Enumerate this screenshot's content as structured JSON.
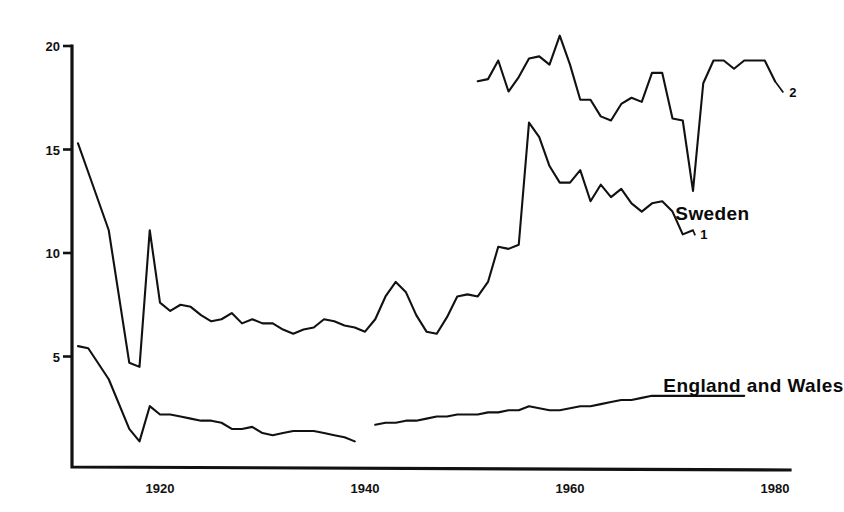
{
  "chart_data": {
    "type": "line",
    "title": "",
    "subtitle": "",
    "xlabel": "",
    "ylabel": "",
    "xlim": [
      1911,
      1981
    ],
    "ylim": [
      0,
      20.8
    ],
    "grid": false,
    "legend_position": "inline-annotations",
    "y_ticks": [
      5,
      10,
      15,
      20
    ],
    "y_tick_labels": [
      "5",
      "10",
      "15",
      "20"
    ],
    "x_ticks": [
      1920,
      1940,
      1960,
      1980
    ],
    "x_tick_labels": [
      "1920",
      "1940",
      "1960",
      "1980"
    ],
    "annotations": [
      {
        "text": "Sweden",
        "x": 1973.9,
        "y": 11.95,
        "style": "bold"
      },
      {
        "text": "England and Wales",
        "x": 1977.9,
        "y": 3.62,
        "style": "bold"
      },
      {
        "text": "1",
        "x": 1972.5,
        "y": 10.9,
        "style": "series-end-marker"
      },
      {
        "text": "2",
        "x": 1981.2,
        "y": 17.8,
        "style": "series-end-marker"
      }
    ],
    "series": [
      {
        "name": "Sweden 1",
        "end_label": "1",
        "x": [
          1912,
          1913,
          1915,
          1917,
          1918,
          1919,
          1920,
          1921,
          1922,
          1923,
          1924,
          1925,
          1926,
          1927,
          1928,
          1929,
          1930,
          1931,
          1932,
          1933,
          1934,
          1935,
          1936,
          1937,
          1938,
          1939,
          1940,
          1941,
          1942,
          1943,
          1944,
          1945,
          1946,
          1947,
          1948,
          1949,
          1950,
          1951,
          1952,
          1953,
          1954,
          1955,
          1956,
          1957,
          1958,
          1959,
          1960,
          1961,
          1962,
          1963,
          1964,
          1965,
          1966,
          1967,
          1968,
          1969,
          1970,
          1971,
          1972
        ],
        "values": [
          15.3,
          13.9,
          11.1,
          4.7,
          4.5,
          11.1,
          7.6,
          7.2,
          7.5,
          7.4,
          7.0,
          6.7,
          6.8,
          7.1,
          6.6,
          6.8,
          6.6,
          6.6,
          6.3,
          6.1,
          6.3,
          6.4,
          6.8,
          6.7,
          6.5,
          6.4,
          6.2,
          6.8,
          7.9,
          8.6,
          8.1,
          7.0,
          6.2,
          6.1,
          6.9,
          7.9,
          8.0,
          7.9,
          8.6,
          10.3,
          10.2,
          10.4,
          16.3,
          15.6,
          14.2,
          13.4,
          13.4,
          14.0,
          12.5,
          13.3,
          12.7,
          13.1,
          12.4,
          12.0,
          12.4,
          12.5,
          12.0,
          10.9,
          11.1
        ],
        "style": "solid-line"
      },
      {
        "name": "Sweden 2",
        "end_label": "2",
        "x": [
          1951,
          1952,
          1953,
          1954,
          1955,
          1956,
          1957,
          1958,
          1959,
          1960,
          1961,
          1962,
          1963,
          1964,
          1965,
          1966,
          1967,
          1968,
          1969,
          1970,
          1971,
          1972,
          1973,
          1974,
          1975,
          1976,
          1977,
          1978,
          1979,
          1980
        ],
        "values": [
          18.3,
          18.4,
          19.3,
          17.8,
          18.5,
          19.4,
          19.5,
          19.1,
          20.5,
          19.1,
          17.4,
          17.4,
          16.6,
          16.4,
          17.2,
          17.5,
          17.3,
          18.7,
          18.7,
          16.5,
          16.4,
          13.0,
          18.2,
          19.3,
          19.3,
          18.9,
          19.3,
          19.3,
          19.3,
          18.3
        ],
        "style": "solid-line"
      },
      {
        "name": "England and Wales",
        "segments": [
          {
            "x": [
              1912,
              1913,
              1915,
              1917,
              1918,
              1919,
              1920,
              1921,
              1922,
              1923,
              1924,
              1925,
              1926,
              1927,
              1928,
              1929,
              1930,
              1931,
              1932,
              1933,
              1934,
              1935,
              1936,
              1937,
              1938,
              1939
            ],
            "values": [
              5.5,
              5.4,
              3.9,
              1.5,
              0.9,
              2.6,
              2.2,
              2.2,
              2.1,
              2.0,
              1.9,
              1.9,
              1.8,
              1.5,
              1.5,
              1.6,
              1.3,
              1.2,
              1.3,
              1.4,
              1.4,
              1.4,
              1.3,
              1.2,
              1.1,
              0.9
            ]
          },
          {
            "x": [
              1941,
              1942,
              1943,
              1944,
              1945,
              1946,
              1947,
              1948,
              1949,
              1950,
              1951,
              1952,
              1953,
              1954,
              1955,
              1956,
              1957,
              1958,
              1959,
              1960,
              1961,
              1962,
              1963,
              1964,
              1965,
              1966,
              1967,
              1968,
              1969,
              1970,
              1971,
              1972,
              1973,
              1974,
              1975,
              1976,
              1977
            ],
            "values": [
              1.7,
              1.8,
              1.8,
              1.9,
              1.9,
              2.0,
              2.1,
              2.1,
              2.2,
              2.2,
              2.2,
              2.3,
              2.3,
              2.4,
              2.4,
              2.6,
              2.5,
              2.4,
              2.4,
              2.5,
              2.6,
              2.6,
              2.7,
              2.8,
              2.9,
              2.9,
              3.0,
              3.1,
              3.1,
              3.1,
              3.1,
              3.1,
              3.1,
              3.1,
              3.1,
              3.1,
              3.1
            ]
          }
        ],
        "style": "solid-line"
      }
    ],
    "colors": {
      "line": "#111111",
      "axis": "#111111",
      "background": "#ffffff",
      "text": "#0a0a0a"
    }
  }
}
